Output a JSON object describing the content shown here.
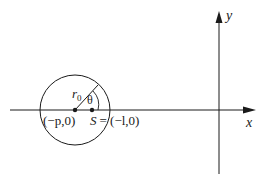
{
  "diagram": {
    "type": "geometry",
    "axes": {
      "x_label": "x",
      "y_label": "y"
    },
    "circle": {
      "radius_label_base": "r",
      "radius_label_sub": "0",
      "angle_label": "θ"
    },
    "points": {
      "center_label": "(−p,0)",
      "source_label_name": "S",
      "source_label_eq": "= (−l,0)"
    }
  },
  "colors": {
    "ink": "#1a1a1a",
    "background": "#ffffff"
  }
}
